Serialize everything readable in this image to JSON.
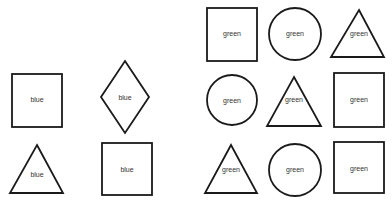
{
  "groups": [
    {
      "name": "blue-group",
      "shapes": [
        {
          "type": "square",
          "label": "blue",
          "x": 12,
          "y": 74,
          "w": 50,
          "h": 53
        },
        {
          "type": "diamond",
          "label": "blue",
          "cx": 125,
          "cy": 97,
          "rx": 24,
          "ry": 36
        },
        {
          "type": "triangle",
          "label": "blue",
          "apex": [
            37,
            145
          ],
          "left": [
            10,
            193
          ],
          "right": [
            63,
            193
          ]
        },
        {
          "type": "square",
          "label": "blue",
          "x": 102,
          "y": 143,
          "w": 50,
          "h": 52
        }
      ]
    },
    {
      "name": "green-group",
      "shapes": [
        {
          "type": "square",
          "label": "green",
          "x": 207,
          "y": 8,
          "w": 50,
          "h": 53
        },
        {
          "type": "circle",
          "label": "green",
          "cx": 295,
          "cy": 34,
          "r": 26
        },
        {
          "type": "triangle",
          "label": "green",
          "apex": [
            359,
            10
          ],
          "left": [
            331,
            57
          ],
          "right": [
            384,
            57
          ]
        },
        {
          "type": "circle",
          "label": "green",
          "cx": 232,
          "cy": 100,
          "r": 25
        },
        {
          "type": "triangle",
          "label": "green",
          "apex": [
            294,
            77
          ],
          "left": [
            267,
            126
          ],
          "right": [
            321,
            126
          ]
        },
        {
          "type": "square",
          "label": "green",
          "x": 334,
          "y": 73,
          "w": 50,
          "h": 54
        },
        {
          "type": "triangle",
          "label": "green",
          "apex": [
            231,
            145
          ],
          "left": [
            205,
            193
          ],
          "right": [
            257,
            193
          ]
        },
        {
          "type": "circle",
          "label": "green",
          "cx": 295,
          "cy": 170,
          "r": 26
        },
        {
          "type": "square",
          "label": "green",
          "x": 334,
          "y": 142,
          "w": 50,
          "h": 51
        }
      ]
    }
  ]
}
